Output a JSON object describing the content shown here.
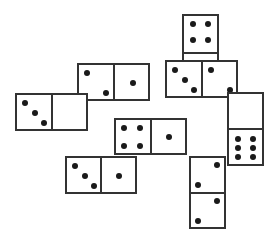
{
  "colors": {
    "outline": "#333333",
    "pip": "#1a1a1a",
    "background": "#ffffff"
  },
  "dominoes": [
    {
      "id": "top-square-four",
      "orientation": "v",
      "halves": [
        4,
        0
      ],
      "note": "lower half hidden"
    },
    {
      "id": "top-right-three-two",
      "orientation": "h",
      "halves": [
        3,
        2
      ]
    },
    {
      "id": "top-left-two-one",
      "orientation": "h",
      "halves": [
        2,
        1
      ]
    },
    {
      "id": "left-three-blank",
      "orientation": "h",
      "halves": [
        3,
        0
      ]
    },
    {
      "id": "center-four-one",
      "orientation": "h",
      "halves": [
        4,
        1
      ]
    },
    {
      "id": "bottom-left-three-one",
      "orientation": "h",
      "halves": [
        3,
        1
      ]
    },
    {
      "id": "right-vertical-blank-six",
      "orientation": "v",
      "halves": [
        0,
        6
      ]
    },
    {
      "id": "bottom-vertical-two-two",
      "orientation": "v",
      "halves": [
        2,
        2
      ]
    }
  ]
}
